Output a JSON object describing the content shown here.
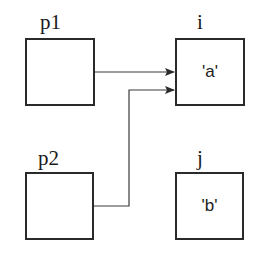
{
  "diagram": {
    "type": "pointer-memory-diagram",
    "nodes": [
      {
        "id": "p1",
        "label": "p1",
        "value": ""
      },
      {
        "id": "p2",
        "label": "p2",
        "value": ""
      },
      {
        "id": "i",
        "label": "i",
        "value": "'a'"
      },
      {
        "id": "j",
        "label": "j",
        "value": "'b'"
      }
    ],
    "edges": [
      {
        "from": "p1",
        "to": "i"
      },
      {
        "from": "p2",
        "to": "i"
      }
    ],
    "colors": {
      "stroke": "#2a2a2a",
      "background": "#ffffff",
      "text": "#1a1a1a"
    }
  }
}
